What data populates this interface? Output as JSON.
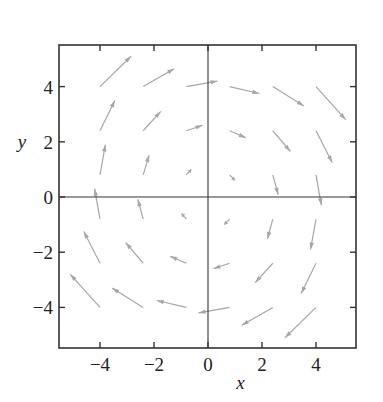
{
  "chart_data": {
    "type": "quiver",
    "title": "",
    "xlabel": "x",
    "ylabel": "y",
    "xlim": [
      -5.5,
      5.5
    ],
    "ylim": [
      -5.5,
      5.3
    ],
    "xticks": [
      -4,
      -2,
      0,
      2,
      4
    ],
    "yticks": [
      -4,
      -2,
      0,
      2,
      4
    ],
    "xtick_labels": [
      "−4",
      "−2",
      "0",
      "2",
      "4"
    ],
    "ytick_labels": [
      "−4",
      "−2",
      "0",
      "2",
      "4"
    ],
    "grid": false,
    "axes_lines_through_origin": true,
    "arrow_color": "#a6a6a6",
    "axis_color": "#333333",
    "grid_points": [
      -4,
      -2.4,
      -0.8,
      0.8,
      2.4,
      4
    ],
    "arrows": [
      {
        "x": -4,
        "y": 4,
        "u": 1.15,
        "v": 1.1
      },
      {
        "x": -2.4,
        "y": 4,
        "u": 1.15,
        "v": 0.65
      },
      {
        "x": -0.8,
        "y": 4,
        "u": 1.15,
        "v": 0.2
      },
      {
        "x": 0.8,
        "y": 4,
        "u": 1.1,
        "v": -0.25
      },
      {
        "x": 2.4,
        "y": 4,
        "u": 1.15,
        "v": -0.7
      },
      {
        "x": 4,
        "y": 4,
        "u": 1.1,
        "v": -1.2
      },
      {
        "x": -4,
        "y": 2.4,
        "u": 0.55,
        "v": 1.1
      },
      {
        "x": -2.4,
        "y": 2.4,
        "u": 0.65,
        "v": 0.7
      },
      {
        "x": -0.8,
        "y": 2.4,
        "u": 0.6,
        "v": 0.2
      },
      {
        "x": 0.8,
        "y": 2.4,
        "u": 0.6,
        "v": -0.25
      },
      {
        "x": 2.4,
        "y": 2.4,
        "u": 0.65,
        "v": -0.75
      },
      {
        "x": 4,
        "y": 2.4,
        "u": 0.6,
        "v": -1.15
      },
      {
        "x": -4,
        "y": 0.8,
        "u": 0.2,
        "v": 1.1
      },
      {
        "x": -2.4,
        "y": 0.8,
        "u": 0.22,
        "v": 0.72
      },
      {
        "x": -0.8,
        "y": 0.8,
        "u": 0.18,
        "v": 0.2
      },
      {
        "x": 0.8,
        "y": 0.8,
        "u": 0.2,
        "v": -0.2
      },
      {
        "x": 2.4,
        "y": 0.8,
        "u": 0.2,
        "v": -0.72
      },
      {
        "x": 4,
        "y": 0.8,
        "u": 0.2,
        "v": -1.1
      },
      {
        "x": -4,
        "y": -0.8,
        "u": -0.2,
        "v": 1.1
      },
      {
        "x": -2.4,
        "y": -0.8,
        "u": -0.2,
        "v": 0.72
      },
      {
        "x": -0.8,
        "y": -0.8,
        "u": -0.18,
        "v": 0.2
      },
      {
        "x": 0.8,
        "y": -0.8,
        "u": -0.2,
        "v": -0.2
      },
      {
        "x": 2.4,
        "y": -0.8,
        "u": -0.2,
        "v": -0.72
      },
      {
        "x": 4,
        "y": -0.8,
        "u": -0.2,
        "v": -1.1
      },
      {
        "x": -4,
        "y": -2.4,
        "u": -0.6,
        "v": 1.15
      },
      {
        "x": -2.4,
        "y": -2.4,
        "u": -0.65,
        "v": 0.75
      },
      {
        "x": -0.8,
        "y": -2.4,
        "u": -0.6,
        "v": 0.25
      },
      {
        "x": 0.8,
        "y": -2.4,
        "u": -0.6,
        "v": -0.2
      },
      {
        "x": 2.4,
        "y": -2.4,
        "u": -0.65,
        "v": -0.7
      },
      {
        "x": 4,
        "y": -2.4,
        "u": -0.55,
        "v": -1.1
      },
      {
        "x": -4,
        "y": -4,
        "u": -1.1,
        "v": 1.2
      },
      {
        "x": -2.4,
        "y": -4,
        "u": -1.15,
        "v": 0.7
      },
      {
        "x": -0.8,
        "y": -4,
        "u": -1.1,
        "v": 0.25
      },
      {
        "x": 0.8,
        "y": -4,
        "u": -1.15,
        "v": -0.2
      },
      {
        "x": 2.4,
        "y": -4,
        "u": -1.15,
        "v": -0.65
      },
      {
        "x": 4,
        "y": -4,
        "u": -1.15,
        "v": -1.1
      }
    ]
  },
  "plot": {
    "xlabel": "x",
    "ylabel": "y"
  }
}
